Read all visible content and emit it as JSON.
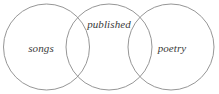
{
  "diagram": {
    "type": "venn-diagram",
    "background_color": "#ffffff",
    "stroke_color": "#8a8a8a",
    "text_color": "#3a3a3a",
    "circles": [
      {
        "name": "songs-circle",
        "cx": 46.5,
        "cy": 47,
        "r": 43
      },
      {
        "name": "published-circle",
        "cx": 109,
        "cy": 47,
        "r": 43
      },
      {
        "name": "poetry-circle",
        "cx": 171,
        "cy": 47,
        "r": 43
      }
    ],
    "labels": {
      "left": "songs",
      "middle": "published",
      "right": "poetry"
    }
  }
}
